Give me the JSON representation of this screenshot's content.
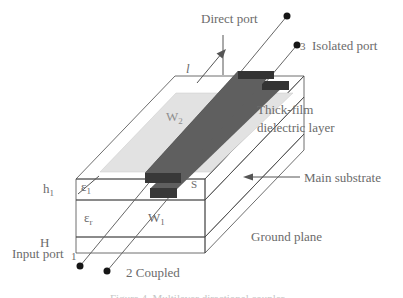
{
  "figure": {
    "ports": {
      "direct_label": "Direct port",
      "isolated_number": "3",
      "isolated_label": "Isolated port",
      "input_label": "Input port",
      "input_number": "1",
      "coupled_label": "2 Coupled"
    },
    "annotations": {
      "length_symbol": "l",
      "thick_film_line1": "Thick-film",
      "thick_film_line2": "dielectric layer",
      "main_substrate": "Main substrate",
      "ground_plane": "Ground plane"
    },
    "dimensions": {
      "h1_base": "h",
      "h1_sub": "1",
      "H": "H",
      "eps1_base": "ε",
      "eps1_sub": "1",
      "epsr_base": "ε",
      "epsr_sub": "r",
      "S": "S",
      "W1_base": "W",
      "W1_sub": "1",
      "W2_base": "W",
      "W2_sub": "2"
    },
    "caption_fragment": "Figure 4. Multilayer directional coupler"
  },
  "colors": {
    "strip_top": "#5f5f5f",
    "strip_side": "#3e3e3e",
    "strip_end_front": "#383838",
    "strip_end_back": "#333333",
    "dielectric_face": "#ffffff",
    "gray_top_region": "#e2e2e2",
    "substrate_front": "#e6e6e6",
    "substrate_side": "#b7b7b7",
    "ground_front": "#9e9e9e",
    "ground_side": "#8e8e8e",
    "dot": "#161616",
    "label_text": "#6b6b6b"
  }
}
